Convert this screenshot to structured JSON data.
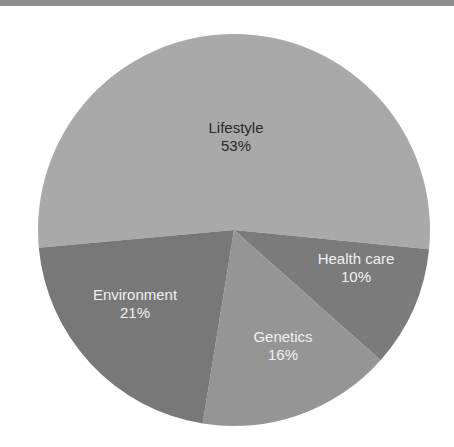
{
  "header": {
    "rule_color": "#8f8f8f"
  },
  "chart_data": {
    "type": "pie",
    "title": "",
    "start_angle_deg": 174.8,
    "direction": "clockwise",
    "center": [
      234,
      230
    ],
    "radius": 196,
    "slices": [
      {
        "label": "Lifestyle",
        "value": 53,
        "value_label": "53%",
        "color": "#a9a9a9",
        "text_color": "#2a2a2a",
        "label_pos": [
          236,
          137
        ]
      },
      {
        "label": "Health care",
        "value": 10,
        "value_label": "10%",
        "color": "#7b7b7b",
        "text_color": "#f0f0f0",
        "label_pos": [
          356,
          268
        ]
      },
      {
        "label": "Genetics",
        "value": 16,
        "value_label": "16%",
        "color": "#959595",
        "text_color": "#f0f0f0",
        "label_pos": [
          283,
          346
        ]
      },
      {
        "label": "Environment",
        "value": 21,
        "value_label": "21%",
        "color": "#787878",
        "text_color": "#f0f0f0",
        "label_pos": [
          135,
          304
        ]
      }
    ]
  }
}
